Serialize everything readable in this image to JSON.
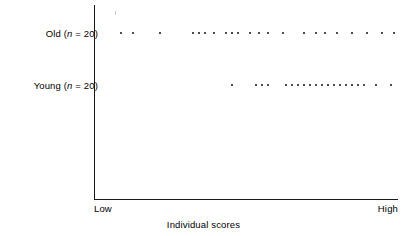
{
  "chart_data": {
    "type": "scatter",
    "title": "",
    "xlabel": "Individual scores",
    "ylabel": "",
    "grid": false,
    "legend": "none",
    "xlim": [
      0,
      100
    ],
    "x_tick_labels": [
      "Low",
      "High"
    ],
    "categories": [
      "Old (n = 20)",
      "Young (n = 20)"
    ],
    "series": [
      {
        "name": "Old",
        "n": 20,
        "label_prefix": "Old (",
        "label_italic": "n",
        "label_suffix": " = 20)",
        "x": [
          8,
          12,
          21,
          32,
          34,
          36,
          39,
          43,
          45,
          47,
          51,
          54,
          57,
          62,
          69,
          73,
          76,
          80,
          85,
          90,
          95,
          99
        ]
      },
      {
        "name": "Young",
        "n": 20,
        "label_prefix": "Young (",
        "label_italic": "n",
        "label_suffix": " = 20)",
        "x": [
          45,
          53,
          55,
          57,
          63,
          65,
          67,
          69,
          71,
          73,
          75,
          77,
          79,
          81,
          83,
          85,
          87,
          89,
          93,
          98
        ]
      }
    ]
  },
  "labels": {
    "row_old": "Old (n = 20)",
    "row_young": "Young (n = 20)",
    "axis_low": "Low",
    "axis_high": "High",
    "axis_title": "Individual scores"
  },
  "colors": {
    "axis": "#1a1a1a",
    "dot": "#2b2b2b",
    "text": "#000000",
    "background": "#ffffff"
  }
}
